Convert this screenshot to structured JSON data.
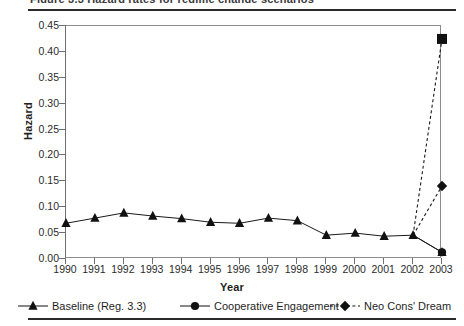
{
  "figure": {
    "caption_sliver": "Figure 3.3 Hazard rates for regime change scenarios"
  },
  "chart_data": {
    "type": "line",
    "title": "",
    "xlabel": "Year",
    "ylabel": "Hazard",
    "grid": false,
    "legend_position": "bottom",
    "categories": [
      1990,
      1991,
      1992,
      1993,
      1994,
      1995,
      1996,
      1997,
      1998,
      1999,
      2000,
      2001,
      2002,
      2003
    ],
    "ytick_labels": [
      "0.45",
      "0.40",
      "0.35",
      "0.30",
      "0.25",
      "0.20",
      "0.15",
      "0.10",
      "0.05",
      "0.00"
    ],
    "ytick_values": [
      0.45,
      0.4,
      0.35,
      0.3,
      0.25,
      0.2,
      0.15,
      0.1,
      0.05,
      0.0
    ],
    "xtick_labels": [
      "1990",
      "1991",
      "1992",
      "1993",
      "1994",
      "1995",
      "1996",
      "1997",
      "1998",
      "1999",
      "2000",
      "2001",
      "2002",
      "2003"
    ],
    "ylim": [
      0.0,
      0.45
    ],
    "xlim": [
      1990,
      2003
    ],
    "series": [
      {
        "name": "Baseline (Reg. 3.3)",
        "marker": "triangle",
        "line_style": "solid",
        "color": "#1a1a1a",
        "x": [
          1990,
          1991,
          1992,
          1993,
          1994,
          1995,
          1996,
          1997,
          1998,
          1999,
          2000,
          2001,
          2002,
          2003
        ],
        "values": [
          0.069,
          0.079,
          0.089,
          0.083,
          0.078,
          0.071,
          0.069,
          0.079,
          0.074,
          0.046,
          0.05,
          0.044,
          0.046,
          0.013
        ]
      },
      {
        "name": "Cooperative Engagement",
        "marker": "circle",
        "line_style": "solid",
        "color": "#1a1a1a",
        "x": [
          2002,
          2003
        ],
        "values": [
          0.046,
          0.013
        ]
      },
      {
        "name": "Neo Cons' Dream",
        "marker": "diamond",
        "line_style": "dashed",
        "color": "#1a1a1a",
        "x": [
          2002,
          2003
        ],
        "values": [
          0.046,
          0.141
        ]
      },
      {
        "name": "Upper scenario",
        "marker": "square",
        "line_style": "dashed",
        "color": "#1a1a1a",
        "x": [
          2002,
          2003
        ],
        "values": [
          0.046,
          0.425
        ]
      }
    ],
    "legend": [
      {
        "label": "Baseline (Reg. 3.3)",
        "marker": "triangle",
        "line_style": "solid"
      },
      {
        "label": "Cooperative Engagement",
        "marker": "circle",
        "line_style": "solid"
      },
      {
        "label": "Neo Cons' Dream",
        "marker": "diamond",
        "line_style": "dashed"
      }
    ]
  }
}
